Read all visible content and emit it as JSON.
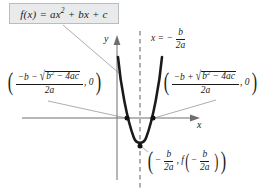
{
  "figure": {
    "title_box": {
      "function_label": "f(x) = ax² + bx + c",
      "fn_name": "f(x)",
      "eq": "=",
      "term_a": "ax",
      "term_a_exp": "2",
      "term_b": "+ bx + c",
      "bg_color": "#e9eaec",
      "border_color": "#b9bcc0"
    },
    "axes": {
      "y_label": "y",
      "x_label": "x",
      "axis_color": "#6e6e6e"
    },
    "axis_of_symmetry": {
      "label_x": "x",
      "label_eq": "=",
      "label_minus": "−",
      "numerator": "b",
      "denominator": "2a",
      "full_text": "x = −b/2a",
      "line_style": "dashed",
      "line_color": "#7a7a7a"
    },
    "left_root": {
      "open_paren": "(",
      "close_paren": ")",
      "num_lead": "−b −",
      "radicand_base": "b",
      "radicand_exp": "2",
      "radicand_rest": "− 4ac",
      "denominator": "2a",
      "second_coord": ", 0",
      "full_text": "((−b − √(b² − 4ac)) / 2a , 0)"
    },
    "right_root": {
      "open_paren": "(",
      "close_paren": ")",
      "num_lead": "−b +",
      "radicand_base": "b",
      "radicand_exp": "2",
      "radicand_rest": "− 4ac",
      "denominator": "2a",
      "second_coord": ", 0",
      "full_text": "((−b + √(b² − 4ac)) / 2a , 0)"
    },
    "vertex": {
      "open_paren": "(",
      "close_paren": ")",
      "x_minus": "−",
      "x_num": "b",
      "x_den": "2a",
      "comma": ",",
      "fn": "f",
      "inner_open": "(",
      "inner_close": ")",
      "inner_minus": "−",
      "inner_num": "b",
      "inner_den": "2a",
      "full_text": "(−b/2a , f(−b/2a))"
    },
    "curve": {
      "name": "parabola",
      "color": "#1a1a1a",
      "stroke_width": 2.6
    },
    "points": [
      {
        "name": "left-root-point",
        "x": 127,
        "y": 118
      },
      {
        "name": "right-root-point",
        "x": 153,
        "y": 118
      },
      {
        "name": "vertex-point",
        "x": 140,
        "y": 146
      }
    ],
    "leader_line_color": "#8a8a8a"
  }
}
